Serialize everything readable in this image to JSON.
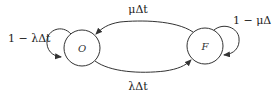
{
  "diagram": {
    "type": "state-transition",
    "states": [
      {
        "id": "O",
        "label": "O"
      },
      {
        "id": "F",
        "label": "F"
      }
    ],
    "transitions": [
      {
        "from": "F",
        "to": "O",
        "label": "μΔt"
      },
      {
        "from": "O",
        "to": "F",
        "label": "λΔt"
      },
      {
        "from": "O",
        "to": "O",
        "label": "1 − λΔt"
      },
      {
        "from": "F",
        "to": "F",
        "label": "1 − μΔ"
      }
    ],
    "colors": {
      "stroke": "#333333",
      "background": "#ffffff"
    }
  }
}
